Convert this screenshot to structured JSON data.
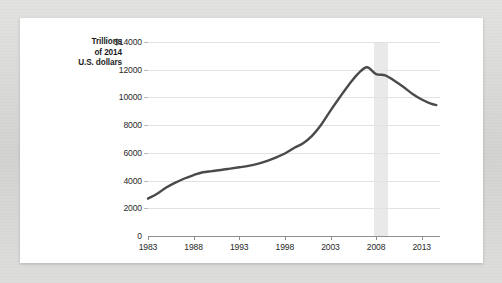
{
  "figure": {
    "axis_caption": "Trillions\nof 2014\nU.S. dollars",
    "currency_prefix": "$",
    "line_color": "#4a4a4a",
    "gridline_color": "#e2e2e2",
    "recession_band_color": "#e9e9e9",
    "card_background": "#ffffff",
    "page_background": "#d8d8d6"
  },
  "chart_data": {
    "type": "line",
    "title": "",
    "xlabel": "",
    "ylabel": "Trillions of 2014 U.S. dollars",
    "xlim": [
      1983,
      2015
    ],
    "ylim": [
      0,
      14000
    ],
    "grid": true,
    "legend": "none",
    "y_ticks": [
      0,
      2000,
      4000,
      6000,
      8000,
      10000,
      12000,
      14000
    ],
    "y_tick_labels": [
      "0",
      "2000",
      "4000",
      "6000",
      "8000",
      "10000",
      "12000",
      "$14000"
    ],
    "x_ticks": [
      1983,
      1988,
      1993,
      1998,
      2003,
      2008,
      2013
    ],
    "x_tick_labels": [
      "1983",
      "1988",
      "1993",
      "1998",
      "2003",
      "2008",
      "2013"
    ],
    "annotations": [
      {
        "type": "vertical-band",
        "name": "recession-shading",
        "x_start": 2007.8,
        "x_end": 2009.3,
        "label": ""
      }
    ],
    "series": [
      {
        "name": "Household debt",
        "color": "#4a4a4a",
        "x": [
          1983,
          1984,
          1985,
          1986,
          1987,
          1988,
          1989,
          1990,
          1991,
          1992,
          1993,
          1994,
          1995,
          1996,
          1997,
          1998,
          1999,
          2000,
          2001,
          2002,
          2003,
          2004,
          2005,
          2006,
          2007,
          2008,
          2009,
          2010,
          2011,
          2012,
          2013,
          2014,
          2014.6
        ],
        "values": [
          2700,
          3050,
          3500,
          3850,
          4150,
          4400,
          4600,
          4680,
          4760,
          4860,
          4960,
          5060,
          5200,
          5400,
          5650,
          5950,
          6350,
          6700,
          7250,
          8050,
          9050,
          10000,
          10900,
          11700,
          12180,
          11680,
          11600,
          11200,
          10750,
          10250,
          9850,
          9550,
          9450
        ]
      }
    ]
  }
}
